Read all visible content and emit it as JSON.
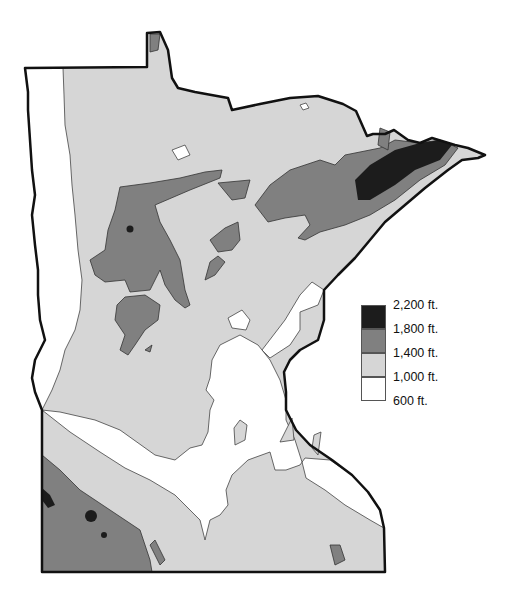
{
  "map": {
    "subject": "Minnesota elevation",
    "colors": {
      "outline": "#111111",
      "level_2200": "#1c1c1c",
      "level_1800": "#808080",
      "level_1400": "#d6d6d6",
      "level_1000": "#ffffff",
      "background": "#ffffff"
    }
  },
  "legend": {
    "items": [
      {
        "label": "2,200 ft.",
        "color": "#1c1c1c"
      },
      {
        "label": "1,800 ft.",
        "color": "#808080"
      },
      {
        "label": "1,400 ft.",
        "color": "#d6d6d6"
      },
      {
        "label": "1,000 ft.",
        "color": "#ffffff"
      },
      {
        "label": "600 ft."
      }
    ]
  }
}
